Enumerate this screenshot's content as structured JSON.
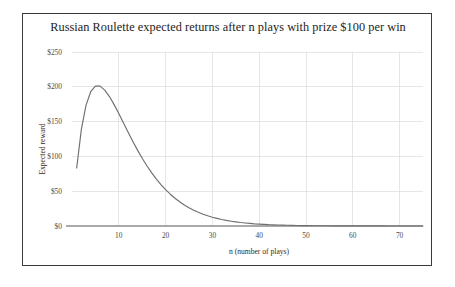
{
  "figure": {
    "border_color": "#3a3a3a",
    "background": "#ffffff"
  },
  "chart_data": {
    "type": "line",
    "title": "Russian Roulette expected returns after n plays with prize $100 per win",
    "xlabel": "n (number of plays)",
    "ylabel": "Expected reward",
    "xlim": [
      0,
      75
    ],
    "ylim": [
      0,
      250
    ],
    "grid": true,
    "legend": null,
    "series_color": "#6f6f6f",
    "formula": "E(n) = 100 * n * (5/6)^n",
    "xticks": [
      10,
      20,
      30,
      40,
      50,
      60,
      70
    ],
    "xtick_labels": [
      "10",
      "20",
      "30",
      "40",
      "50",
      "60",
      "70"
    ],
    "yticks": [
      0,
      50,
      100,
      150,
      200,
      250
    ],
    "ytick_labels": [
      "$0",
      "$50",
      "$100",
      "$150",
      "$200",
      "$250"
    ],
    "series": [
      {
        "name": "Expected reward",
        "x": [
          1,
          2,
          3,
          4,
          5,
          6,
          7,
          8,
          9,
          10,
          11,
          12,
          13,
          14,
          15,
          16,
          17,
          18,
          19,
          20,
          21,
          22,
          23,
          24,
          25,
          26,
          27,
          28,
          29,
          30,
          31,
          32,
          33,
          34,
          35,
          36,
          37,
          38,
          39,
          40,
          41,
          42,
          43,
          44,
          45,
          46,
          47,
          48,
          49,
          50,
          52,
          54,
          56,
          58,
          60,
          62,
          64,
          66,
          68,
          70,
          72,
          75
        ],
        "values": [
          83.3,
          138.9,
          173.6,
          192.9,
          200.9,
          200.9,
          195.3,
          186.0,
          174.4,
          161.5,
          148.0,
          134.6,
          121.5,
          109.0,
          97.3,
          86.5,
          76.6,
          67.6,
          59.5,
          52.2,
          45.7,
          39.9,
          34.8,
          30.2,
          26.2,
          22.7,
          19.7,
          17.0,
          14.7,
          12.6,
          10.9,
          9.3,
          8.0,
          6.9,
          5.9,
          5.0,
          4.3,
          3.7,
          3.1,
          2.7,
          2.3,
          1.9,
          1.7,
          1.4,
          1.2,
          1.0,
          0.9,
          0.7,
          0.6,
          0.5,
          0.4,
          0.3,
          0.2,
          0.2,
          0.1,
          0.1,
          0.1,
          0.1,
          0.0,
          0.0,
          0.0,
          0.0
        ]
      }
    ]
  }
}
